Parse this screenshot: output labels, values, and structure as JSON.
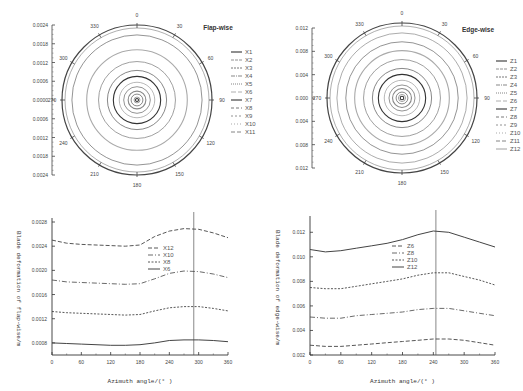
{
  "chart_data": [
    {
      "type": "polar",
      "title": "Flap-wise",
      "angle_ticks": [
        "0",
        "30",
        "60",
        "90",
        "120",
        "150",
        "180",
        "210",
        "240",
        "270",
        "300",
        "330"
      ],
      "radial_axis_ticks": [
        "0.0024",
        "0.0018",
        "0.0012",
        "0.0006",
        "0.0000",
        "0.0006",
        "0.0012",
        "0.0018",
        "0.0024"
      ],
      "legend": [
        "X1",
        "X2",
        "X3",
        "X4",
        "X5",
        "X6",
        "X7",
        "X8",
        "X9",
        "X10",
        "X11"
      ],
      "series": [
        {
          "name": "X1",
          "radius": 5e-05
        },
        {
          "name": "X2",
          "radius": 0.0001
        },
        {
          "name": "X3",
          "radius": 0.0002
        },
        {
          "name": "X4",
          "radius": 0.0003
        },
        {
          "name": "X5",
          "radius": 0.00045
        },
        {
          "name": "X6",
          "radius": 0.0006
        },
        {
          "name": "X7",
          "radius": 0.0008
        },
        {
          "name": "X8",
          "radius": 0.001
        },
        {
          "name": "X9",
          "radius": 0.0013
        },
        {
          "name": "X10",
          "radius": 0.0017
        },
        {
          "name": "X11",
          "radius": 0.0022
        }
      ],
      "rlim": [
        0,
        0.0024
      ]
    },
    {
      "type": "polar",
      "title": "Edge-wise",
      "angle_ticks": [
        "0",
        "30",
        "60",
        "90",
        "120",
        "150",
        "180",
        "210",
        "240",
        "270",
        "300",
        "330"
      ],
      "radial_axis_ticks": [
        "0.012",
        "0.008",
        "0.004",
        "0.000",
        "0.004",
        "0.008",
        "0.012"
      ],
      "legend": [
        "Z1",
        "Z2",
        "Z3",
        "Z4",
        "Z5",
        "Z6",
        "Z7",
        "Z8",
        "Z9",
        "Z10",
        "Z11",
        "Z12"
      ],
      "series": [
        {
          "name": "Z1",
          "radius": 0.0003
        },
        {
          "name": "Z2",
          "radius": 0.0006
        },
        {
          "name": "Z3",
          "radius": 0.001
        },
        {
          "name": "Z4",
          "radius": 0.0016
        },
        {
          "name": "Z5",
          "radius": 0.0022
        },
        {
          "name": "Z6",
          "radius": 0.003
        },
        {
          "name": "Z7",
          "radius": 0.004
        },
        {
          "name": "Z8",
          "radius": 0.005
        },
        {
          "name": "Z9",
          "radius": 0.0065
        },
        {
          "name": "Z10",
          "radius": 0.008
        },
        {
          "name": "Z11",
          "radius": 0.0095
        },
        {
          "name": "Z12",
          "radius": 0.011
        }
      ],
      "rlim": [
        0,
        0.012
      ]
    },
    {
      "type": "line",
      "title": "",
      "xlabel": "Azimuth angle/(° )",
      "ylabel": "Blade deformation of flap-wise/m",
      "x": [
        0,
        30,
        60,
        90,
        120,
        150,
        180,
        210,
        240,
        270,
        300,
        330,
        360
      ],
      "xticks": [
        "0",
        "60",
        "120",
        "180",
        "240",
        "300",
        "360"
      ],
      "yticks": [
        "0.0008",
        "0.0012",
        "0.0016",
        "0.0020",
        "0.0024",
        "0.0028"
      ],
      "ylim": [
        0.0006,
        0.0028
      ],
      "xlim": [
        0,
        360
      ],
      "vline_x": 290,
      "legend": [
        "X12",
        "X10",
        "X8",
        "X6"
      ],
      "series": [
        {
          "name": "X12",
          "values": [
            0.0025,
            0.00245,
            0.00243,
            0.00242,
            0.00241,
            0.0024,
            0.00242,
            0.00256,
            0.00265,
            0.00269,
            0.00268,
            0.00262,
            0.00254
          ]
        },
        {
          "name": "X10",
          "values": [
            0.00184,
            0.00181,
            0.0018,
            0.00179,
            0.00178,
            0.00177,
            0.00178,
            0.00186,
            0.00195,
            0.00199,
            0.00198,
            0.00194,
            0.00188
          ]
        },
        {
          "name": "X8",
          "values": [
            0.00132,
            0.0013,
            0.00129,
            0.00128,
            0.00127,
            0.00126,
            0.00127,
            0.00133,
            0.00138,
            0.0014,
            0.0014,
            0.00137,
            0.00133
          ]
        },
        {
          "name": "X6",
          "values": [
            0.0008,
            0.00079,
            0.00078,
            0.00077,
            0.00076,
            0.00076,
            0.00077,
            0.0008,
            0.00084,
            0.00085,
            0.00085,
            0.00084,
            0.00082
          ]
        }
      ],
      "grid": false,
      "legend_position": "upper right (inside)"
    },
    {
      "type": "line",
      "title": "",
      "xlabel": "Azimuth angle/(° )",
      "ylabel": "Blade deformation of edge-wise/m",
      "x": [
        0,
        30,
        60,
        90,
        120,
        150,
        180,
        210,
        240,
        270,
        300,
        330,
        360
      ],
      "xticks": [
        "0",
        "60",
        "120",
        "180",
        "240",
        "300",
        "360"
      ],
      "yticks": [
        "0.002",
        "0.004",
        "0.006",
        "0.008",
        "0.010",
        "0.012"
      ],
      "ylim": [
        0.002,
        0.013
      ],
      "xlim": [
        0,
        360
      ],
      "vline_x": 245,
      "legend": [
        "Z6",
        "Z8",
        "Z10",
        "Z12"
      ],
      "series": [
        {
          "name": "Z6",
          "values": [
            0.0028,
            0.0027,
            0.0027,
            0.0028,
            0.0029,
            0.003,
            0.0031,
            0.0032,
            0.0033,
            0.0033,
            0.0032,
            0.003,
            0.0028
          ]
        },
        {
          "name": "Z8",
          "values": [
            0.0051,
            0.005,
            0.005,
            0.0052,
            0.0053,
            0.0054,
            0.0055,
            0.0057,
            0.0058,
            0.0058,
            0.0056,
            0.0054,
            0.0052
          ]
        },
        {
          "name": "Z10",
          "values": [
            0.0075,
            0.0074,
            0.0074,
            0.0076,
            0.0078,
            0.008,
            0.0082,
            0.0085,
            0.0087,
            0.0087,
            0.0084,
            0.0081,
            0.0077
          ]
        },
        {
          "name": "Z12",
          "values": [
            0.0106,
            0.0104,
            0.0105,
            0.0107,
            0.0109,
            0.0111,
            0.0114,
            0.0118,
            0.0121,
            0.012,
            0.0116,
            0.0112,
            0.0108
          ]
        }
      ],
      "grid": false,
      "legend_position": "upper center (inside)"
    }
  ]
}
